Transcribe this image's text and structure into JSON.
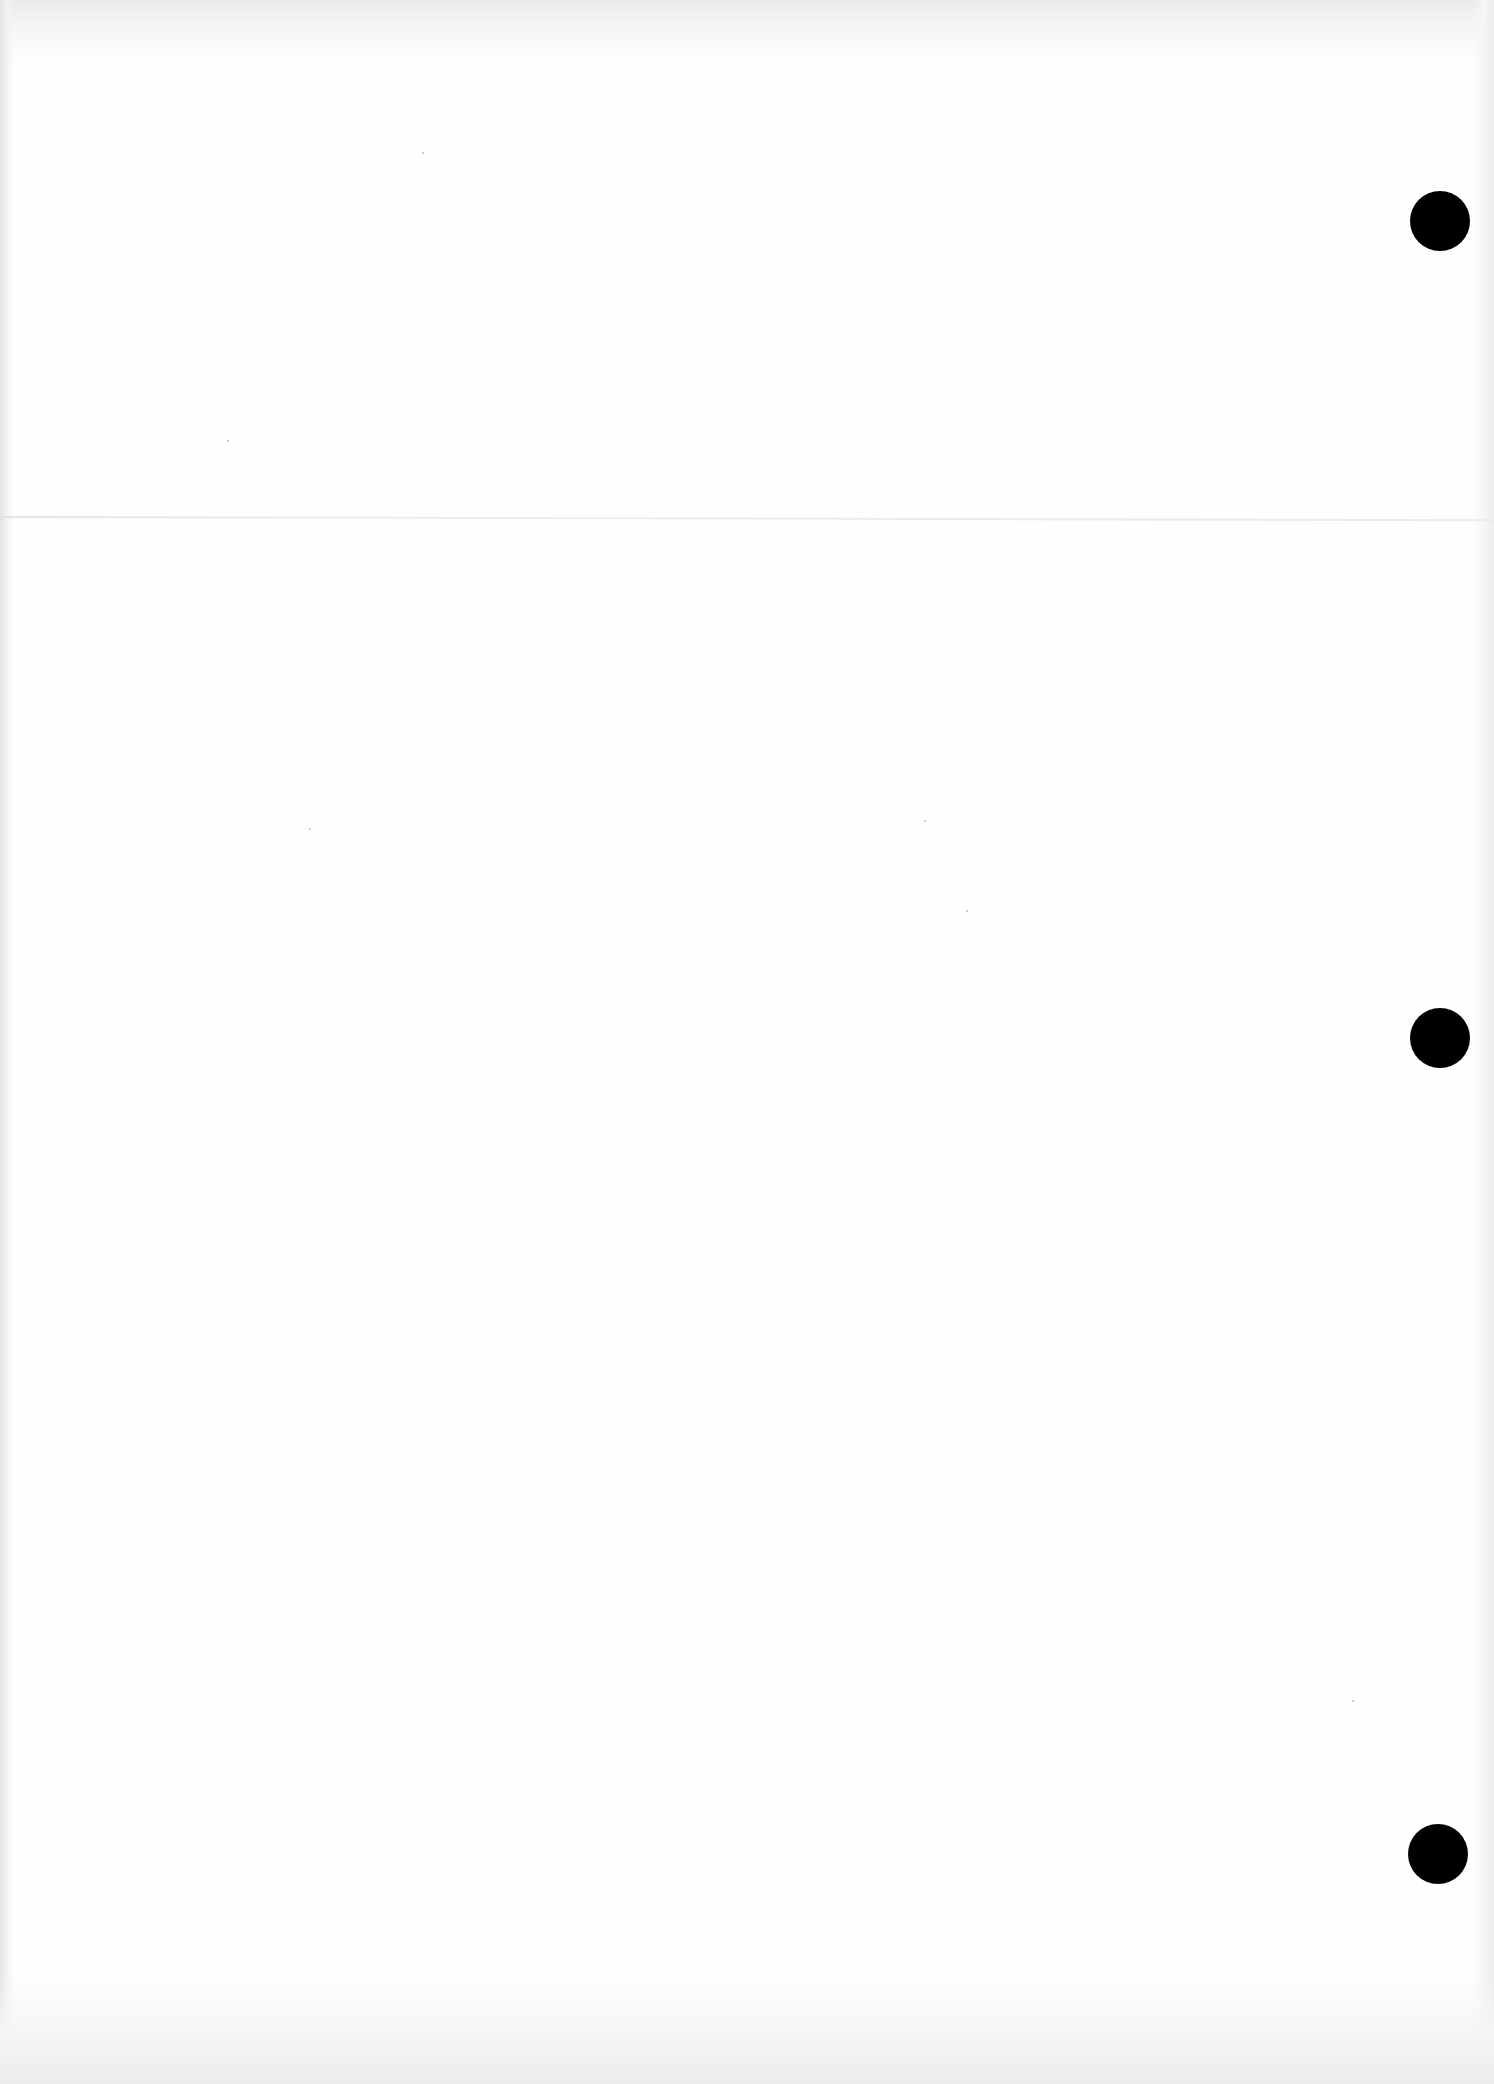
{
  "page": {
    "type": "blank-scanned-sheet",
    "background_color": "#fefefe",
    "text_content": []
  },
  "punch_holes": [
    {
      "cx": 1440,
      "cy": 221,
      "r": 30,
      "color": "#000000"
    },
    {
      "cx": 1440,
      "cy": 1038,
      "r": 30,
      "color": "#000000"
    },
    {
      "cx": 1438,
      "cy": 1854,
      "r": 30,
      "color": "#000000"
    }
  ],
  "fold_line": {
    "y": 517,
    "color": "#e6e6e6"
  }
}
